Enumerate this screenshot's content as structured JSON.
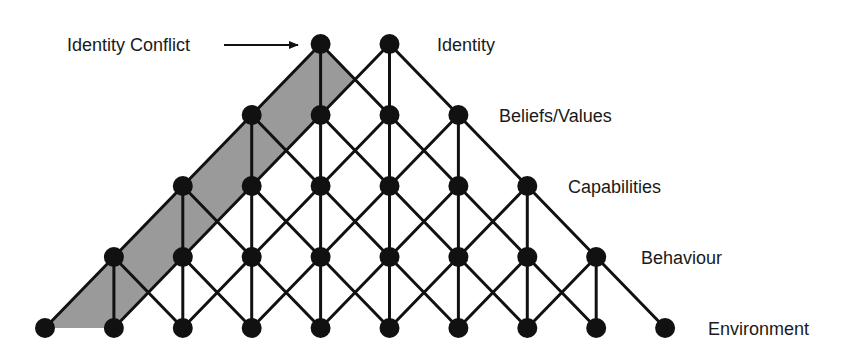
{
  "diagram": {
    "colors": {
      "background": "#ffffff",
      "line": "#111111",
      "node": "#111111",
      "shade": "#9a9a9a",
      "text": "#1a1a1a"
    },
    "geometry": {
      "x0": 45,
      "dx": 68.9,
      "rows_y": [
        44,
        115,
        186,
        257,
        328
      ],
      "node_radius": 10,
      "line_width": 3
    },
    "levels": [
      {
        "name": "Identity",
        "label_x": 437,
        "label_y": 51,
        "node_count": 2,
        "start_index": 4
      },
      {
        "name": "Beliefs/Values",
        "label_x": 499,
        "label_y": 122,
        "node_count": 4,
        "start_index": 3
      },
      {
        "name": "Capabilities",
        "label_x": 568,
        "label_y": 193,
        "node_count": 6,
        "start_index": 2
      },
      {
        "name": "Behaviour",
        "label_x": 641,
        "label_y": 264,
        "node_count": 8,
        "start_index": 1
      },
      {
        "name": "Environment",
        "label_x": 708,
        "label_y": 335,
        "node_count": 10,
        "start_index": 0
      }
    ],
    "annotation": {
      "text": "Identity Conflict",
      "text_x": 67,
      "text_y": 51,
      "arrow_from": [
        224,
        45
      ],
      "arrow_to": [
        298,
        45
      ]
    },
    "shaded_region": {
      "points": [
        [
          320,
          44
        ],
        [
          355,
          80
        ],
        [
          113,
          328
        ],
        [
          45,
          328
        ]
      ]
    }
  }
}
